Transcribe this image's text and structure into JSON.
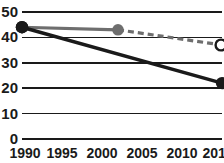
{
  "chart_data": {
    "type": "line",
    "title": "",
    "subtitle": "",
    "xlabel": "",
    "ylabel": "",
    "xlim": [
      1990,
      2015
    ],
    "ylim": [
      0,
      50
    ],
    "grid": true,
    "legend": "none",
    "x_ticks": [
      1990,
      1995,
      2000,
      2005,
      2010,
      2015
    ],
    "x_tick_labels": [
      "1990",
      "1995",
      "2000",
      "2005",
      "2010",
      "2015"
    ],
    "y_ticks": [
      0,
      10,
      20,
      30,
      40,
      50
    ],
    "y_tick_labels": [
      "0",
      "10",
      "20",
      "30",
      "40",
      "50"
    ],
    "series": [
      {
        "name": "gray-series",
        "color": "#6e6e6e",
        "style": "solid-then-dashed",
        "x": [
          1990,
          2002,
          2015
        ],
        "values": [
          44,
          43,
          37
        ],
        "markers": [
          {
            "x": 1990,
            "y": 44,
            "kind": "filled-dark"
          },
          {
            "x": 2002,
            "y": 43,
            "kind": "filled-gray"
          },
          {
            "x": 2015,
            "y": 37,
            "kind": "open"
          }
        ],
        "dashed_from_x": 2002
      },
      {
        "name": "dark-series",
        "color": "#1a1a1a",
        "style": "solid",
        "x": [
          1990,
          2015
        ],
        "values": [
          44,
          22
        ],
        "markers": [
          {
            "x": 1990,
            "y": 44,
            "kind": "filled-dark"
          },
          {
            "x": 2015,
            "y": 22,
            "kind": "filled-dark"
          }
        ]
      }
    ]
  },
  "colors": {
    "background": "#ffffff",
    "axis": "#1a1a1a",
    "grid": "#1a1a1a",
    "series_dark": "#1a1a1a",
    "series_gray": "#6e6e6e",
    "marker_open_fill": "#ffffff"
  }
}
